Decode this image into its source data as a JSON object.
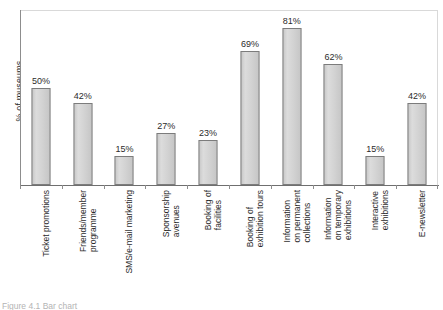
{
  "chart_data": {
    "type": "bar",
    "title": "",
    "xlabel": "",
    "ylabel": "% of museums",
    "ylim": [
      0,
      90
    ],
    "grid": false,
    "legend": false,
    "value_suffix": "%",
    "categories": [
      "Ticket promotions",
      "Friends/member programme",
      "SMS/e-mail marketing",
      "Sponsorship avenues",
      "Booking of facilities",
      "Booking of exhibition tours",
      "Information on permanent collections",
      "Information on temporary exhibitions",
      "Interactive exhibitions",
      "E-newsletter"
    ],
    "category_lines": [
      [
        "Ticket promotions"
      ],
      [
        "Friends/member",
        "programme"
      ],
      [
        "SMS/e-mail marketing"
      ],
      [
        "Sponsorship",
        "avenues"
      ],
      [
        "Booking of",
        "facilities"
      ],
      [
        "Booking of",
        "exhibition tours"
      ],
      [
        "Information",
        "on permanent",
        "collections"
      ],
      [
        "Information",
        "on temporary",
        "exhibitions"
      ],
      [
        "Interactive",
        "exhibitions"
      ],
      [
        "E-newsletter"
      ]
    ],
    "values": [
      50,
      42,
      15,
      27,
      23,
      69,
      81,
      62,
      15,
      42
    ],
    "value_labels": [
      "50%",
      "42%",
      "15%",
      "27%",
      "23%",
      "69%",
      "81%",
      "62%",
      "15%",
      "42%"
    ]
  },
  "style": {
    "bar_fill": "#d3d3d3",
    "bar_stroke": "#7c7c7c",
    "text_color": "#2b2b2b",
    "frame_color": "#d9d9d9",
    "axis_color": "#8d8d8d"
  },
  "caption": {
    "text": "Figure 4.1  Bar chart"
  }
}
